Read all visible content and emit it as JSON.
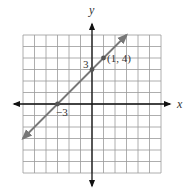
{
  "chart_data": {
    "type": "line",
    "title": "",
    "xlabel": "x",
    "ylabel": "y",
    "xlim": [
      -6,
      6
    ],
    "ylim": [
      -6,
      6
    ],
    "grid": true,
    "grid_step": 1,
    "series": [
      {
        "name": "y = x + 3",
        "slope": 1,
        "intercept": 3,
        "x": [
          -6,
          3
        ],
        "y": [
          -3,
          6
        ],
        "arrows": "both",
        "color": "#777777"
      }
    ],
    "points": [
      {
        "x": -3,
        "y": 0,
        "label": "−3"
      },
      {
        "x": 0,
        "y": 3,
        "label": "3"
      },
      {
        "x": 1,
        "y": 4,
        "label": "(1, 4)"
      }
    ],
    "annotations": [
      "−3",
      "3",
      "(1, 4)"
    ]
  },
  "labels": {
    "x_axis": "x",
    "y_axis": "y",
    "x_intercept": "−3",
    "y_intercept": "3",
    "point": "(1, 4)"
  }
}
